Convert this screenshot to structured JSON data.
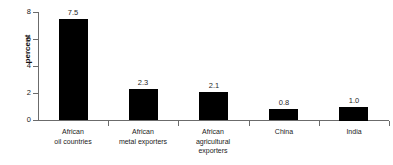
{
  "chart_data": {
    "type": "bar",
    "title": "",
    "subtitle": "",
    "xlabel": "",
    "ylabel": "percent",
    "ylim": [
      0,
      8
    ],
    "yticks": [
      "0",
      "2",
      "4",
      "6",
      "8"
    ],
    "grid": false,
    "legend": null,
    "orientation": "vertical",
    "bar_color": "#000000",
    "axis_color": "#6b6b6b",
    "background": "#ffffff",
    "categories": [
      "African oil countries",
      "African metal exporters",
      "African agricultural exporters",
      "China",
      "India"
    ],
    "category_lines": [
      [
        "African",
        "oil countries"
      ],
      [
        "African",
        "metal exporters"
      ],
      [
        "African",
        "agricultural",
        "exporters"
      ],
      [
        "China"
      ],
      [
        "India"
      ]
    ],
    "values": [
      7.5,
      2.3,
      2.1,
      0.8,
      1.0
    ],
    "value_labels": [
      "7.5",
      "2.3",
      "2.1",
      "0.8",
      "1.0"
    ]
  }
}
